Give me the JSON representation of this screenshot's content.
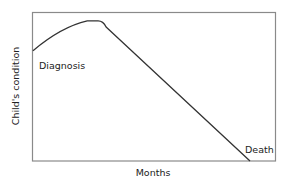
{
  "chart_data": {
    "type": "line",
    "title": "",
    "xlabel": "Months",
    "ylabel": "Child's condition",
    "grid": false,
    "legend": null,
    "xlim": [
      0,
      100
    ],
    "ylim": [
      0,
      100
    ],
    "series": [
      {
        "name": "Child's condition",
        "x": [
          0,
          13,
          25,
          30,
          74,
          100
        ],
        "y": [
          74,
          90,
          94,
          94,
          20,
          0
        ]
      }
    ],
    "annotations": [
      {
        "text": "Diagnosis",
        "x": 5,
        "y": 68
      },
      {
        "text": "Death",
        "x": 90,
        "y": 8
      }
    ],
    "colors": {
      "line": "#333333",
      "frame": "#888888"
    }
  },
  "labels": {
    "xlabel": "Months",
    "ylabel": "Child's condition",
    "diagnosis": "Diagnosis",
    "death": "Death"
  }
}
